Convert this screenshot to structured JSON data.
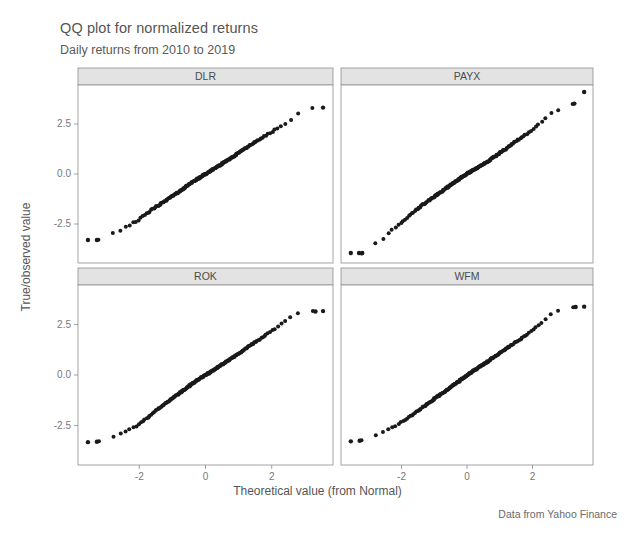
{
  "header": {
    "title": "QQ plot for normalized returns",
    "subtitle": "Daily returns from 2010 to 2019"
  },
  "caption": "Data from Yahoo Finance",
  "axes": {
    "xlabel": "Theoretical value (from Normal)",
    "ylabel": "True/observed value",
    "x_ticks": [
      "-2",
      "0",
      "2"
    ],
    "x_tick_values": [
      -2,
      0,
      2
    ],
    "y_ticks": [
      "-2.5",
      "0.0",
      "2.5"
    ],
    "y_tick_values": [
      -2.5,
      0.0,
      2.5
    ],
    "xlim": [
      -3.85,
      3.85
    ],
    "ylim": [
      -4.45,
      4.45
    ]
  },
  "facets": [
    {
      "label": "DLR",
      "row": 0,
      "col": 0
    },
    {
      "label": "PAYX",
      "row": 0,
      "col": 1
    },
    {
      "label": "ROK",
      "row": 1,
      "col": 0
    },
    {
      "label": "WFM",
      "row": 1,
      "col": 1
    }
  ],
  "chart_data": {
    "type": "scatter",
    "title": "QQ plot for normalized returns",
    "subtitle": "Daily returns from 2010 to 2019",
    "caption": "Data from Yahoo Finance",
    "xlabel": "Theoretical value (from Normal)",
    "ylabel": "True/observed value",
    "grid": false,
    "legend": "none",
    "facet_layout": "2x2",
    "xlim": [
      -3.85,
      3.85
    ],
    "ylim": [
      -4.45,
      4.45
    ],
    "xticks": [
      -2,
      0,
      2
    ],
    "yticks": [
      -2.5,
      0.0,
      2.5
    ],
    "n_points_per_facet": 180,
    "panels": [
      {
        "name": "DLR",
        "quantile_curve": [
          [
            -3.55,
            -3.3
          ],
          [
            -3.3,
            -3.28
          ],
          [
            -3.05,
            -3.32
          ],
          [
            -2.85,
            -3.0
          ],
          [
            -2.72,
            -2.9
          ],
          [
            -2.6,
            -2.85
          ],
          [
            -2.5,
            -2.8
          ],
          [
            -2.4,
            -2.62
          ],
          [
            -2.3,
            -2.58
          ],
          [
            -2.2,
            -2.45
          ],
          [
            -2.1,
            -2.4
          ],
          [
            -2.0,
            -2.28
          ],
          [
            -1.85,
            -2.05
          ],
          [
            -1.7,
            -1.9
          ],
          [
            -1.55,
            -1.7
          ],
          [
            -1.4,
            -1.55
          ],
          [
            -1.25,
            -1.38
          ],
          [
            -1.1,
            -1.22
          ],
          [
            -0.95,
            -1.05
          ],
          [
            -0.8,
            -0.9
          ],
          [
            -0.65,
            -0.72
          ],
          [
            -0.5,
            -0.52
          ],
          [
            -0.35,
            -0.35
          ],
          [
            -0.2,
            -0.2
          ],
          [
            -0.05,
            -0.05
          ],
          [
            0.1,
            0.1
          ],
          [
            0.25,
            0.25
          ],
          [
            0.4,
            0.4
          ],
          [
            0.55,
            0.56
          ],
          [
            0.7,
            0.72
          ],
          [
            0.85,
            0.88
          ],
          [
            1.0,
            1.05
          ],
          [
            1.15,
            1.22
          ],
          [
            1.3,
            1.38
          ],
          [
            1.45,
            1.55
          ],
          [
            1.6,
            1.7
          ],
          [
            1.75,
            1.85
          ],
          [
            1.9,
            2.0
          ],
          [
            2.05,
            2.15
          ],
          [
            2.2,
            2.3
          ],
          [
            2.35,
            2.45
          ],
          [
            2.5,
            2.62
          ],
          [
            2.65,
            2.8
          ],
          [
            2.78,
            3.0
          ],
          [
            2.9,
            3.18
          ],
          [
            3.0,
            3.25
          ],
          [
            3.15,
            3.28
          ],
          [
            3.3,
            3.3
          ],
          [
            3.55,
            3.32
          ]
        ],
        "outliers_low": [
          [
            -3.55,
            -3.3
          ],
          [
            -3.28,
            -3.3
          ]
        ],
        "outliers_high": [
          [
            3.55,
            3.32
          ]
        ]
      },
      {
        "name": "PAYX",
        "quantile_curve": [
          [
            -3.55,
            -3.95
          ],
          [
            -3.32,
            -3.95
          ],
          [
            -3.22,
            -3.95
          ],
          [
            -3.0,
            -3.62
          ],
          [
            -2.85,
            -3.5
          ],
          [
            -2.72,
            -3.42
          ],
          [
            -2.6,
            -3.3
          ],
          [
            -2.5,
            -3.1
          ],
          [
            -2.4,
            -2.95
          ],
          [
            -2.3,
            -2.82
          ],
          [
            -2.2,
            -2.7
          ],
          [
            -2.1,
            -2.55
          ],
          [
            -2.0,
            -2.42
          ],
          [
            -1.85,
            -2.22
          ],
          [
            -1.7,
            -2.0
          ],
          [
            -1.55,
            -1.8
          ],
          [
            -1.4,
            -1.6
          ],
          [
            -1.25,
            -1.42
          ],
          [
            -1.1,
            -1.25
          ],
          [
            -0.95,
            -1.08
          ],
          [
            -0.8,
            -0.9
          ],
          [
            -0.65,
            -0.72
          ],
          [
            -0.5,
            -0.55
          ],
          [
            -0.35,
            -0.38
          ],
          [
            -0.2,
            -0.2
          ],
          [
            -0.05,
            -0.04
          ],
          [
            0.1,
            0.1
          ],
          [
            0.25,
            0.25
          ],
          [
            0.4,
            0.4
          ],
          [
            0.55,
            0.55
          ],
          [
            0.7,
            0.7
          ],
          [
            0.85,
            0.88
          ],
          [
            1.0,
            1.05
          ],
          [
            1.15,
            1.22
          ],
          [
            1.3,
            1.4
          ],
          [
            1.45,
            1.58
          ],
          [
            1.6,
            1.75
          ],
          [
            1.75,
            1.92
          ],
          [
            1.9,
            2.1
          ],
          [
            2.05,
            2.3
          ],
          [
            2.2,
            2.5
          ],
          [
            2.35,
            2.7
          ],
          [
            2.5,
            2.95
          ],
          [
            2.62,
            3.12
          ],
          [
            2.75,
            3.18
          ],
          [
            2.9,
            3.3
          ],
          [
            3.05,
            3.4
          ],
          [
            3.28,
            3.52
          ],
          [
            3.58,
            4.1
          ]
        ],
        "outliers_low": [
          [
            -3.55,
            -3.95
          ],
          [
            -3.3,
            -3.95
          ],
          [
            -3.2,
            -3.95
          ]
        ],
        "outliers_high": [
          [
            3.58,
            4.1
          ],
          [
            3.28,
            3.52
          ]
        ]
      },
      {
        "name": "ROK",
        "quantile_curve": [
          [
            -3.55,
            -3.32
          ],
          [
            -3.3,
            -3.3
          ],
          [
            -3.12,
            -3.28
          ],
          [
            -2.95,
            -3.12
          ],
          [
            -2.85,
            -3.1
          ],
          [
            -2.72,
            -3.05
          ],
          [
            -2.62,
            -3.0
          ],
          [
            -2.52,
            -2.82
          ],
          [
            -2.42,
            -2.78
          ],
          [
            -2.3,
            -2.7
          ],
          [
            -2.18,
            -2.6
          ],
          [
            -2.05,
            -2.48
          ],
          [
            -1.92,
            -2.32
          ],
          [
            -1.78,
            -2.15
          ],
          [
            -1.62,
            -1.95
          ],
          [
            -1.48,
            -1.75
          ],
          [
            -1.32,
            -1.55
          ],
          [
            -1.18,
            -1.38
          ],
          [
            -1.02,
            -1.18
          ],
          [
            -0.88,
            -1.0
          ],
          [
            -0.72,
            -0.82
          ],
          [
            -0.58,
            -0.65
          ],
          [
            -0.42,
            -0.45
          ],
          [
            -0.28,
            -0.3
          ],
          [
            -0.12,
            -0.12
          ],
          [
            0.02,
            0.02
          ],
          [
            0.18,
            0.18
          ],
          [
            0.32,
            0.33
          ],
          [
            0.48,
            0.5
          ],
          [
            0.62,
            0.65
          ],
          [
            0.78,
            0.82
          ],
          [
            0.92,
            0.98
          ],
          [
            1.08,
            1.15
          ],
          [
            1.22,
            1.32
          ],
          [
            1.38,
            1.5
          ],
          [
            1.52,
            1.65
          ],
          [
            1.68,
            1.82
          ],
          [
            1.82,
            1.98
          ],
          [
            1.98,
            2.15
          ],
          [
            2.12,
            2.32
          ],
          [
            2.28,
            2.52
          ],
          [
            2.42,
            2.7
          ],
          [
            2.58,
            2.88
          ],
          [
            2.72,
            3.0
          ],
          [
            2.85,
            3.08
          ],
          [
            3.0,
            3.12
          ],
          [
            3.18,
            3.14
          ],
          [
            3.32,
            3.14
          ],
          [
            3.55,
            3.16
          ]
        ],
        "outliers_low": [
          [
            -3.55,
            -3.32
          ],
          [
            -3.28,
            -3.3
          ]
        ],
        "outliers_high": [
          [
            3.55,
            3.16
          ],
          [
            3.32,
            3.14
          ]
        ]
      },
      {
        "name": "WFM",
        "quantile_curve": [
          [
            -3.55,
            -3.28
          ],
          [
            -3.3,
            -3.25
          ],
          [
            -3.1,
            -3.22
          ],
          [
            -2.95,
            -3.05
          ],
          [
            -2.82,
            -3.0
          ],
          [
            -2.7,
            -2.92
          ],
          [
            -2.58,
            -2.85
          ],
          [
            -2.45,
            -2.72
          ],
          [
            -2.32,
            -2.62
          ],
          [
            -2.2,
            -2.52
          ],
          [
            -2.08,
            -2.4
          ],
          [
            -1.95,
            -2.28
          ],
          [
            -1.82,
            -2.12
          ],
          [
            -1.68,
            -1.98
          ],
          [
            -1.55,
            -1.82
          ],
          [
            -1.4,
            -1.65
          ],
          [
            -1.25,
            -1.48
          ],
          [
            -1.1,
            -1.3
          ],
          [
            -0.95,
            -1.12
          ],
          [
            -0.8,
            -0.95
          ],
          [
            -0.65,
            -0.78
          ],
          [
            -0.5,
            -0.6
          ],
          [
            -0.35,
            -0.42
          ],
          [
            -0.2,
            -0.25
          ],
          [
            -0.05,
            -0.08
          ],
          [
            0.1,
            0.1
          ],
          [
            0.25,
            0.26
          ],
          [
            0.4,
            0.42
          ],
          [
            0.55,
            0.58
          ],
          [
            0.7,
            0.75
          ],
          [
            0.85,
            0.92
          ],
          [
            1.0,
            1.08
          ],
          [
            1.15,
            1.25
          ],
          [
            1.3,
            1.42
          ],
          [
            1.45,
            1.58
          ],
          [
            1.6,
            1.75
          ],
          [
            1.75,
            1.92
          ],
          [
            1.9,
            2.1
          ],
          [
            2.05,
            2.28
          ],
          [
            2.2,
            2.48
          ],
          [
            2.35,
            2.68
          ],
          [
            2.48,
            2.88
          ],
          [
            2.6,
            3.05
          ],
          [
            2.72,
            3.12
          ],
          [
            2.88,
            3.22
          ],
          [
            3.02,
            3.3
          ],
          [
            3.18,
            3.34
          ],
          [
            3.32,
            3.36
          ],
          [
            3.58,
            3.38
          ]
        ],
        "outliers_low": [
          [
            -3.55,
            -3.28
          ],
          [
            -3.28,
            -3.25
          ]
        ],
        "outliers_high": [
          [
            3.58,
            3.38
          ],
          [
            3.32,
            3.36
          ]
        ]
      }
    ]
  }
}
